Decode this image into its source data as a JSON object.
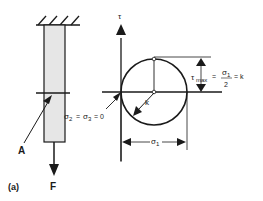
{
  "figure": {
    "panel_label": "(a)",
    "bar": {
      "point_label": "A",
      "force_label": "F",
      "fill_color": "#e6e6e6"
    },
    "mohr": {
      "axis_label": "τ",
      "tau_max_sym": "τ",
      "tau_max_sub": "max",
      "eq1": "=",
      "num_sym": "σ",
      "num_sub": "1",
      "denom": "2",
      "eq2": "= k",
      "radius_label": "k",
      "sigma23_a": "σ",
      "sigma23_a_sub": "2",
      "sigma23_eq": "=",
      "sigma23_b": "σ",
      "sigma23_b_sub": "3",
      "sigma23_tail": "= 0",
      "sigma1_sym": "σ",
      "sigma1_sub": "1"
    },
    "colors": {
      "line": "#1a1a1a",
      "bar_fill": "#e6e6e6"
    }
  }
}
